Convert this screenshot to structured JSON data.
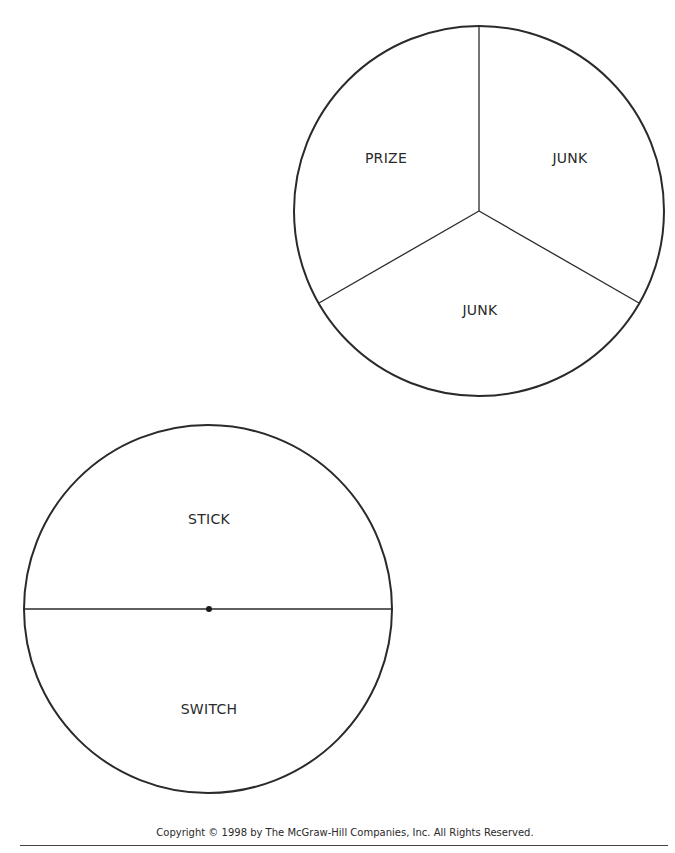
{
  "colors": {
    "stroke": "#2a2a2a",
    "background": "#ffffff",
    "text": "#2a2a2a"
  },
  "spinner_three": {
    "center": [
      479,
      211
    ],
    "radius": 185,
    "sections": [
      {
        "label": "PRIZE",
        "label_pos": [
          386,
          158
        ]
      },
      {
        "label": "JUNK",
        "label_pos": [
          570,
          158
        ]
      },
      {
        "label": "JUNK",
        "label_pos": [
          480,
          310
        ]
      }
    ],
    "dividers": [
      {
        "from": [
          479,
          211
        ],
        "to": [
          479,
          26
        ]
      },
      {
        "from": [
          479,
          211
        ],
        "to": [
          319,
          303
        ]
      },
      {
        "from": [
          479,
          211
        ],
        "to": [
          639,
          303
        ]
      }
    ]
  },
  "spinner_two": {
    "center": [
      208,
      609
    ],
    "radius": 184,
    "sections": [
      {
        "label": "STICK",
        "label_pos": [
          209,
          519
        ]
      },
      {
        "label": "SWITCH",
        "label_pos": [
          209,
          709
        ]
      }
    ],
    "diameter": {
      "from": [
        24,
        609
      ],
      "to": [
        392,
        609
      ]
    },
    "pivot_dot": [
      209,
      609
    ]
  },
  "footer": {
    "copyright": "Copyright © 1998 by The McGraw-Hill Companies, Inc. All Rights Reserved."
  }
}
